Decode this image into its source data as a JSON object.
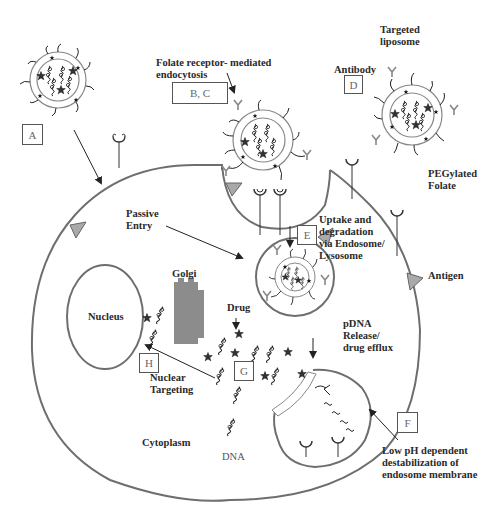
{
  "figure": {
    "labels": {
      "folate_endocytosis": "Folate receptor- mediated\nendocytosis",
      "targeted_liposome": "Targeted\nliposome",
      "antibody": "Antibody",
      "pegylated_folate": "PEGylated\nFolate",
      "passive_entry": "Passive\nEntry",
      "uptake": "Uptake and\ndegradation\nvia Endosome/\nLysosome",
      "antigen": "Antigen",
      "golgi": "Golgi",
      "nucleus": "Nucleus",
      "drug": "Drug",
      "pdna_release": "pDNA\nRelease/\ndrug efflux",
      "nuclear_targeting": "Nuclear\nTargeting",
      "cytoplasm": "Cytoplasm",
      "dna": "DNA",
      "low_ph": "Low pH dependent\ndestabilization of\nendosome membrane"
    },
    "boxes": {
      "A": "A",
      "BC": "B, C",
      "D": "D",
      "E": "E",
      "F": "F",
      "G": "G",
      "H": "H"
    },
    "colors": {
      "outline": "#6e6e6e",
      "golgi": "#8c8c8c",
      "antigen": "#a9a9a9",
      "text": "#2a2a2a"
    }
  }
}
